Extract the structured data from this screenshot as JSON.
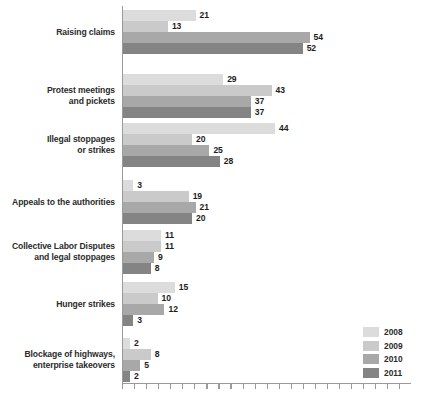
{
  "chart_data": {
    "type": "bar",
    "orientation": "horizontal",
    "title": "",
    "subtitle": "",
    "xlabel": "",
    "ylabel": "",
    "xlim": [
      0,
      84
    ],
    "grid": false,
    "legend_position": "bottom-right",
    "categories": [
      "Raising claims",
      "Protest meetings and pickets",
      "Illegal stoppages or strikes",
      "Appeals to the authorities",
      "Collective Labor Disputes and legal stoppages",
      "Hunger strikes",
      "Blockage of highways, enterprise takeovers"
    ],
    "category_lines": [
      [
        "Raising claims"
      ],
      [
        "Protest meetings",
        "and pickets"
      ],
      [
        "Illegal stoppages",
        "or strikes"
      ],
      [
        "Appeals to the authorities"
      ],
      [
        "Collective Labor Disputes",
        "and legal stoppages"
      ],
      [
        "Hunger strikes"
      ],
      [
        "Blockage of highways,",
        "enterprise takeovers"
      ]
    ],
    "series": [
      {
        "name": "2008",
        "color": "#dcdcdc",
        "values": [
          21,
          29,
          44,
          3,
          11,
          15,
          2
        ]
      },
      {
        "name": "2009",
        "color": "#cacaca",
        "values": [
          13,
          43,
          20,
          19,
          11,
          10,
          8
        ]
      },
      {
        "name": "2010",
        "color": "#a8a8a8",
        "values": [
          54,
          37,
          25,
          21,
          9,
          12,
          5
        ]
      },
      {
        "name": "2011",
        "color": "#848484",
        "values": [
          52,
          37,
          28,
          20,
          8,
          3,
          2
        ]
      }
    ]
  },
  "legend": {
    "items": [
      {
        "label": "2008",
        "color": "#dcdcdc"
      },
      {
        "label": "2009",
        "color": "#cacaca"
      },
      {
        "label": "2010",
        "color": "#a8a8a8"
      },
      {
        "label": "2011",
        "color": "#848484"
      }
    ]
  },
  "axis": {
    "line_color": "#9a9a9a",
    "tick_count": 24,
    "tick_step_px": 12.05
  },
  "style": {
    "background": "#ffffff",
    "label_color": "#2b2b2b",
    "value_color": "#1d1d1d"
  }
}
